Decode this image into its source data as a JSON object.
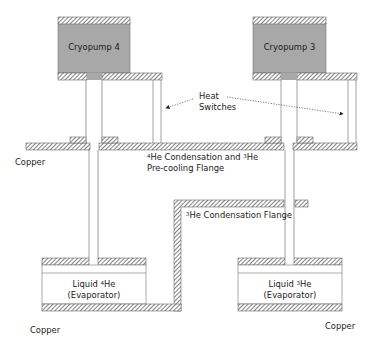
{
  "diagram": {
    "title": "",
    "colors": {
      "pump_fill": "#a8a8a8",
      "hatch_stroke": "#555555",
      "line": "#777777",
      "text": "#1a1a1a"
    },
    "pumps": [
      {
        "id": "cryopump-4",
        "label": "Cryopump 4"
      },
      {
        "id": "cryopump-3",
        "label": "Cryopump 3"
      }
    ],
    "heat_switches": {
      "label_line1": "Heat",
      "label_line2": "Switches"
    },
    "flanges": {
      "upper": {
        "sup1": "4",
        "part1": "He Condensation and ",
        "sup2": "3",
        "part2": "He",
        "line2": "Pre-cooling Flange"
      },
      "he3_condensation": {
        "sup": "3",
        "text": "He Condensation Flange"
      }
    },
    "evaporators": [
      {
        "id": "he4",
        "line1_pre": "Liquid ",
        "sup": "4",
        "line1_post": "He",
        "line2": "(Evaporator)"
      },
      {
        "id": "he3",
        "line1_pre": "Liquid ",
        "sup": "3",
        "line1_post": "He",
        "line2": "(Evaporator)"
      }
    ],
    "material_labels": {
      "copper_upper_left": "Copper",
      "copper_lower_left": "Copper",
      "copper_lower_right": "Copper"
    }
  }
}
